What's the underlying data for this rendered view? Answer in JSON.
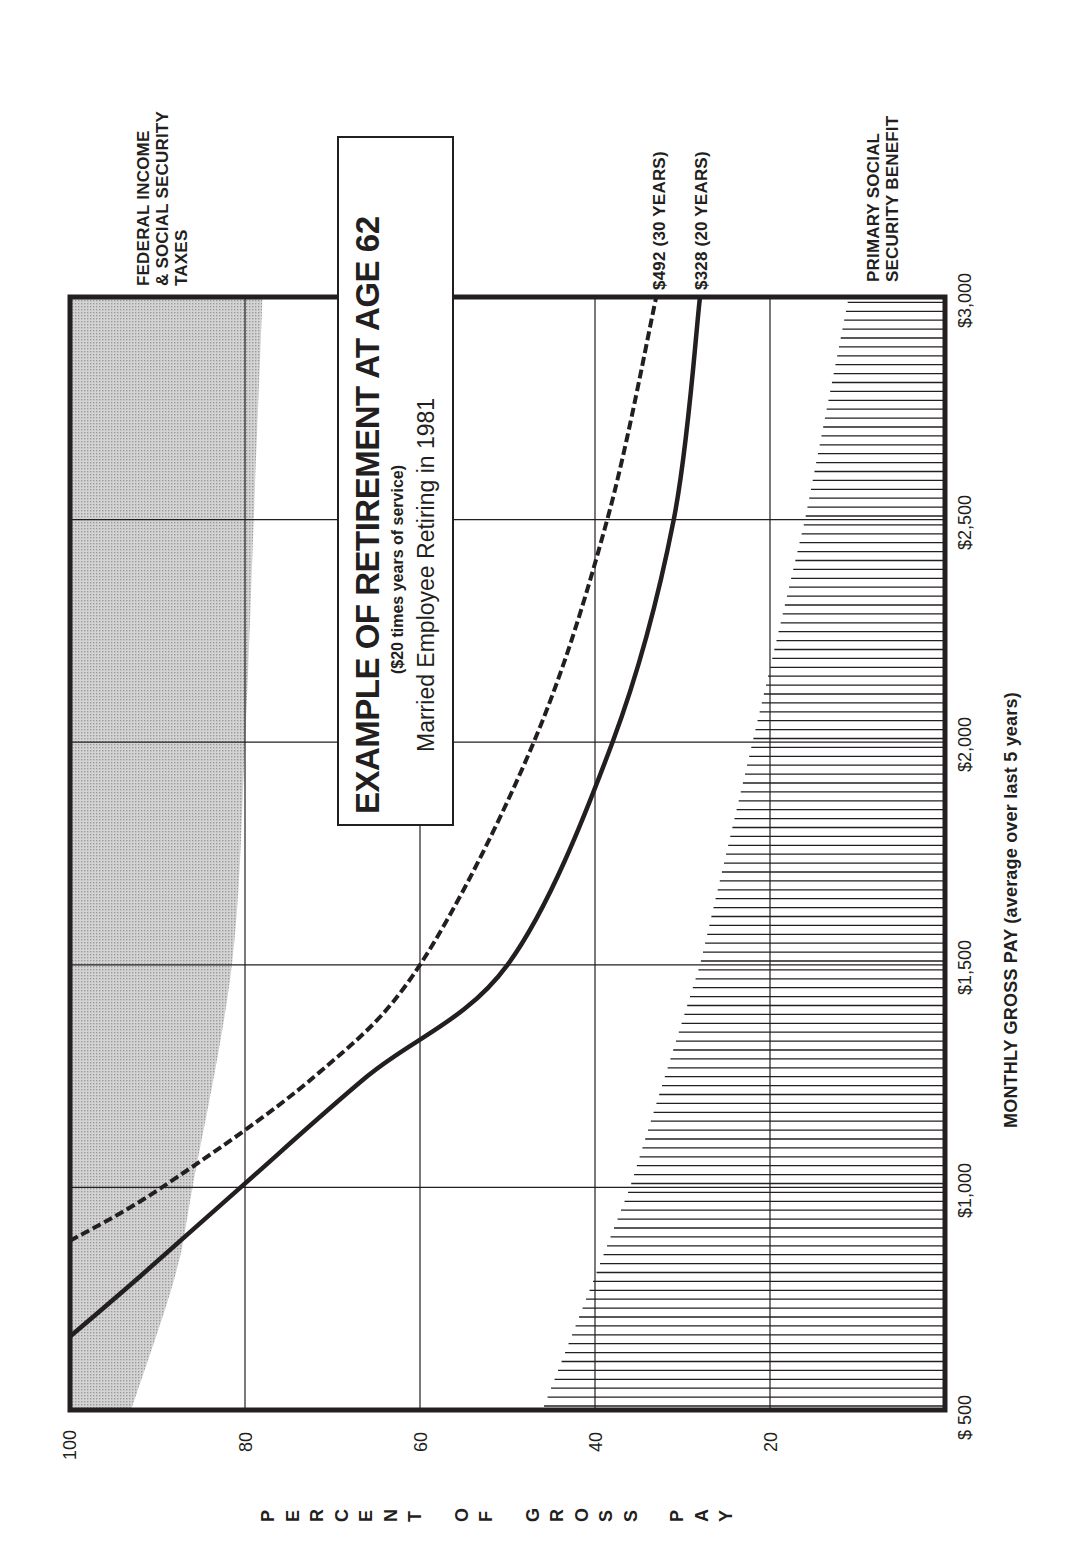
{
  "title_box": {
    "title": "EXAMPLE OF RETIREMENT AT AGE 62",
    "subtitle": "($20 times years of service)",
    "caption": "Married Employee Retiring in 1981"
  },
  "labels": {
    "taxes": [
      "FEDERAL INCOME",
      "& SOCIAL SECURITY",
      "TAXES"
    ],
    "social_security": [
      "PRIMARY SOCIAL",
      "SECURITY BENEFIT"
    ],
    "series_30": "$492 (30 YEARS)",
    "series_20": "$328 (20 YEARS)"
  },
  "axes": {
    "x_title": "MONTHLY GROSS PAY (average over last 5 years)",
    "x_ticks": [
      "$ 500",
      "$1,000",
      "$1,500",
      "$2,000",
      "$2,500",
      "$3,000"
    ],
    "y_ticks": [
      "100",
      "80",
      "60",
      "40",
      "20"
    ],
    "y_title_letters": [
      "P",
      "E",
      "R",
      "C",
      "E",
      "N",
      "T",
      "",
      "O",
      "F",
      "",
      "G",
      "R",
      "O",
      "S",
      "S",
      "",
      "P",
      "A",
      "Y"
    ]
  },
  "colors": {
    "ink": "#231f20",
    "tax_shade": "#c9c9c9",
    "grid": "#231f20",
    "background": "#ffffff"
  },
  "chart_data": {
    "type": "area",
    "title": "EXAMPLE OF RETIREMENT AT AGE 62",
    "subtitle": "($20 times years of service) — Married Employee Retiring in 1981",
    "orientation": "rotated 90° counter-clockwise on page",
    "xlabel": "MONTHLY GROSS PAY (average over last 5 years)",
    "ylabel": "PERCENT OF GROSS PAY",
    "x_ticks": [
      500,
      1000,
      1500,
      2000,
      2500,
      3000
    ],
    "y_ticks": [
      0,
      20,
      40,
      60,
      80,
      100
    ],
    "xlim": [
      500,
      3000
    ],
    "ylim": [
      0,
      100
    ],
    "grid": true,
    "series": [
      {
        "name": "FEDERAL INCOME & SOCIAL SECURITY TAXES",
        "style": "shaded band from 100% downward",
        "x": [
          500,
          800,
          1000,
          1500,
          2000,
          2500,
          3000
        ],
        "lower_bound_pct": [
          93,
          88,
          86,
          81.5,
          80,
          79,
          78
        ],
        "tax_pct": [
          7,
          12,
          14,
          18.5,
          20,
          21,
          22
        ]
      },
      {
        "name": "$492 (30 YEARS)",
        "style": "dashed line (total retirement income, % of gross pay)",
        "x": [
          880,
          1000,
          1250,
          1500,
          2000,
          2500,
          3000
        ],
        "values": [
          100,
          89.5,
          72,
          60,
          47,
          38.6,
          33
        ]
      },
      {
        "name": "$328 (20 YEARS)",
        "style": "solid line (total retirement income, % of gross pay)",
        "x": [
          665,
          800,
          1000,
          1250,
          1500,
          2000,
          2500,
          3000
        ],
        "values": [
          100,
          92,
          80.5,
          66,
          50,
          38,
          31,
          28
        ]
      },
      {
        "name": "PRIMARY SOCIAL SECURITY BENEFIT",
        "style": "vertical hatched area from 0%",
        "x": [
          500,
          1000,
          1500,
          2000,
          2500,
          3000
        ],
        "values": [
          46,
          36,
          28,
          22,
          16,
          11
        ]
      }
    ]
  }
}
